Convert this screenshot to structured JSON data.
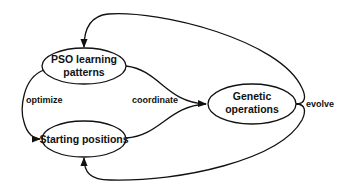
{
  "diagram": {
    "type": "flow-cycle",
    "nodes": [
      {
        "id": "pso",
        "label_line1": "PSO learning",
        "label_line2": "patterns",
        "shape": "ellipse"
      },
      {
        "id": "start",
        "label": "Starting positions",
        "shape": "ellipse"
      },
      {
        "id": "genetic",
        "label_line1": "Genetic",
        "label_line2": "operations",
        "shape": "ellipse"
      }
    ],
    "edges": [
      {
        "from": "pso",
        "to": "start",
        "label": "optimize"
      },
      {
        "from": "pso",
        "to": "genetic",
        "label": "coordinate"
      },
      {
        "from": "start",
        "to": "genetic",
        "label": "coordinate"
      },
      {
        "from": "genetic",
        "to": "pso",
        "label": "evolve"
      },
      {
        "from": "genetic",
        "to": "start",
        "label": "evolve"
      }
    ],
    "labels": {
      "optimize": "optimize",
      "coordinate": "coordinate",
      "evolve": "evolve"
    },
    "colors": {
      "stroke": "#111111",
      "background": "#ffffff"
    }
  }
}
